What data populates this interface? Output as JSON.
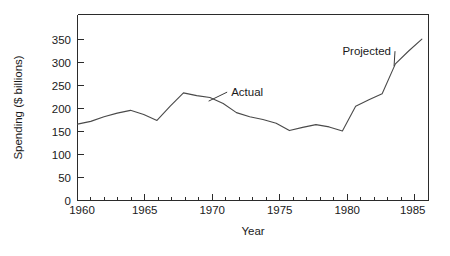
{
  "chart_data": {
    "type": "line",
    "title": "",
    "xlabel": "Year",
    "ylabel": "Spending ($ billions)",
    "xlim": [
      1959,
      1985.5
    ],
    "ylim": [
      0,
      380
    ],
    "grid": false,
    "legend": "none",
    "x_ticks": [
      1960,
      1965,
      1970,
      1975,
      1980,
      1985
    ],
    "x_tick_labels": [
      "1960",
      "1965",
      "1970",
      "1975",
      "1980",
      "1985"
    ],
    "x_minor_tick_interval": 1,
    "y_ticks": [
      0,
      50,
      100,
      150,
      200,
      250,
      300,
      350
    ],
    "y_tick_labels": [
      "0",
      "50",
      "100",
      "150",
      "200",
      "250",
      "300",
      "350"
    ],
    "x": [
      1959,
      1960,
      1961,
      1962,
      1963,
      1964,
      1965,
      1966,
      1967,
      1968,
      1969,
      1970,
      1971,
      1972,
      1973,
      1974,
      1975,
      1976,
      1977,
      1978,
      1979,
      1980,
      1981,
      1982,
      1983,
      1984,
      1985
    ],
    "values": [
      166,
      172,
      182,
      190,
      196,
      187,
      174,
      205,
      234,
      228,
      224,
      211,
      191,
      182,
      176,
      168,
      152,
      159,
      165,
      160,
      151,
      205,
      219,
      232,
      297,
      325,
      351
    ],
    "series": [
      {
        "name": "Spending",
        "values": [
          166,
          172,
          182,
          190,
          196,
          187,
          174,
          205,
          234,
          228,
          224,
          211,
          191,
          182,
          176,
          168,
          152,
          159,
          165,
          160,
          151,
          205,
          219,
          232,
          297,
          325,
          351
        ]
      }
    ],
    "annotations": [
      {
        "label": "Actual",
        "text_x": 1970.6,
        "text_y": 228,
        "point_x": 1968.9,
        "point_y": 216
      },
      {
        "label": "Projected",
        "text_x": 1979.0,
        "text_y": 317,
        "point_x": 1982.9,
        "point_y": 292
      }
    ]
  }
}
